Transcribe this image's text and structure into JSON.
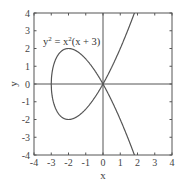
{
  "chart_data": {
    "type": "line",
    "title": "",
    "annotation": {
      "base": "y",
      "sup1": "2",
      "mid": " = x",
      "sup2": "2",
      "tail": "(x + 3)",
      "full": "y^2 = x^2(x + 3)"
    },
    "xlabel": "x",
    "ylabel": "y",
    "xlim": [
      -4,
      4
    ],
    "ylim": [
      -4,
      4
    ],
    "xticks": [
      -4,
      -3,
      -2,
      -1,
      0,
      1,
      2,
      3,
      4
    ],
    "yticks": [
      -4,
      -3,
      -2,
      -1,
      0,
      1,
      2,
      3,
      4
    ],
    "grid": false,
    "zero_lines": true,
    "equation": "y^2 = x^2(x + 3)",
    "series": [
      {
        "name": "upper branch y = x*sqrt(x+3)",
        "x": [
          -3,
          -2.9,
          -2.75,
          -2.5,
          -2.25,
          -2,
          -1.75,
          -1.5,
          -1.25,
          -1,
          -0.75,
          -0.5,
          -0.25,
          0,
          0.25,
          0.5,
          0.75,
          1,
          1.25,
          1.5,
          1.75,
          1.85
        ],
        "y": [
          0,
          -0.92,
          -1.38,
          -1.77,
          -1.95,
          -2.0,
          -1.96,
          -1.84,
          -1.65,
          -1.41,
          -1.13,
          -0.79,
          -0.41,
          0,
          0.45,
          0.94,
          1.45,
          2.0,
          2.58,
          3.18,
          3.81,
          4.07
        ]
      },
      {
        "name": "lower branch y = -x*sqrt(x+3)",
        "x": [
          -3,
          -2.9,
          -2.75,
          -2.5,
          -2.25,
          -2,
          -1.75,
          -1.5,
          -1.25,
          -1,
          -0.75,
          -0.5,
          -0.25,
          0,
          0.25,
          0.5,
          0.75,
          1,
          1.25,
          1.5,
          1.75,
          1.85
        ],
        "y": [
          0,
          0.92,
          1.38,
          1.77,
          1.95,
          2.0,
          1.96,
          1.84,
          1.65,
          1.41,
          1.13,
          0.79,
          0.41,
          0,
          -0.45,
          -0.94,
          -1.45,
          -2.0,
          -2.58,
          -3.18,
          -3.81,
          -4.07
        ]
      }
    ],
    "colors": {
      "curve": "#555555",
      "axes": "#555555",
      "text": "#444444"
    }
  }
}
